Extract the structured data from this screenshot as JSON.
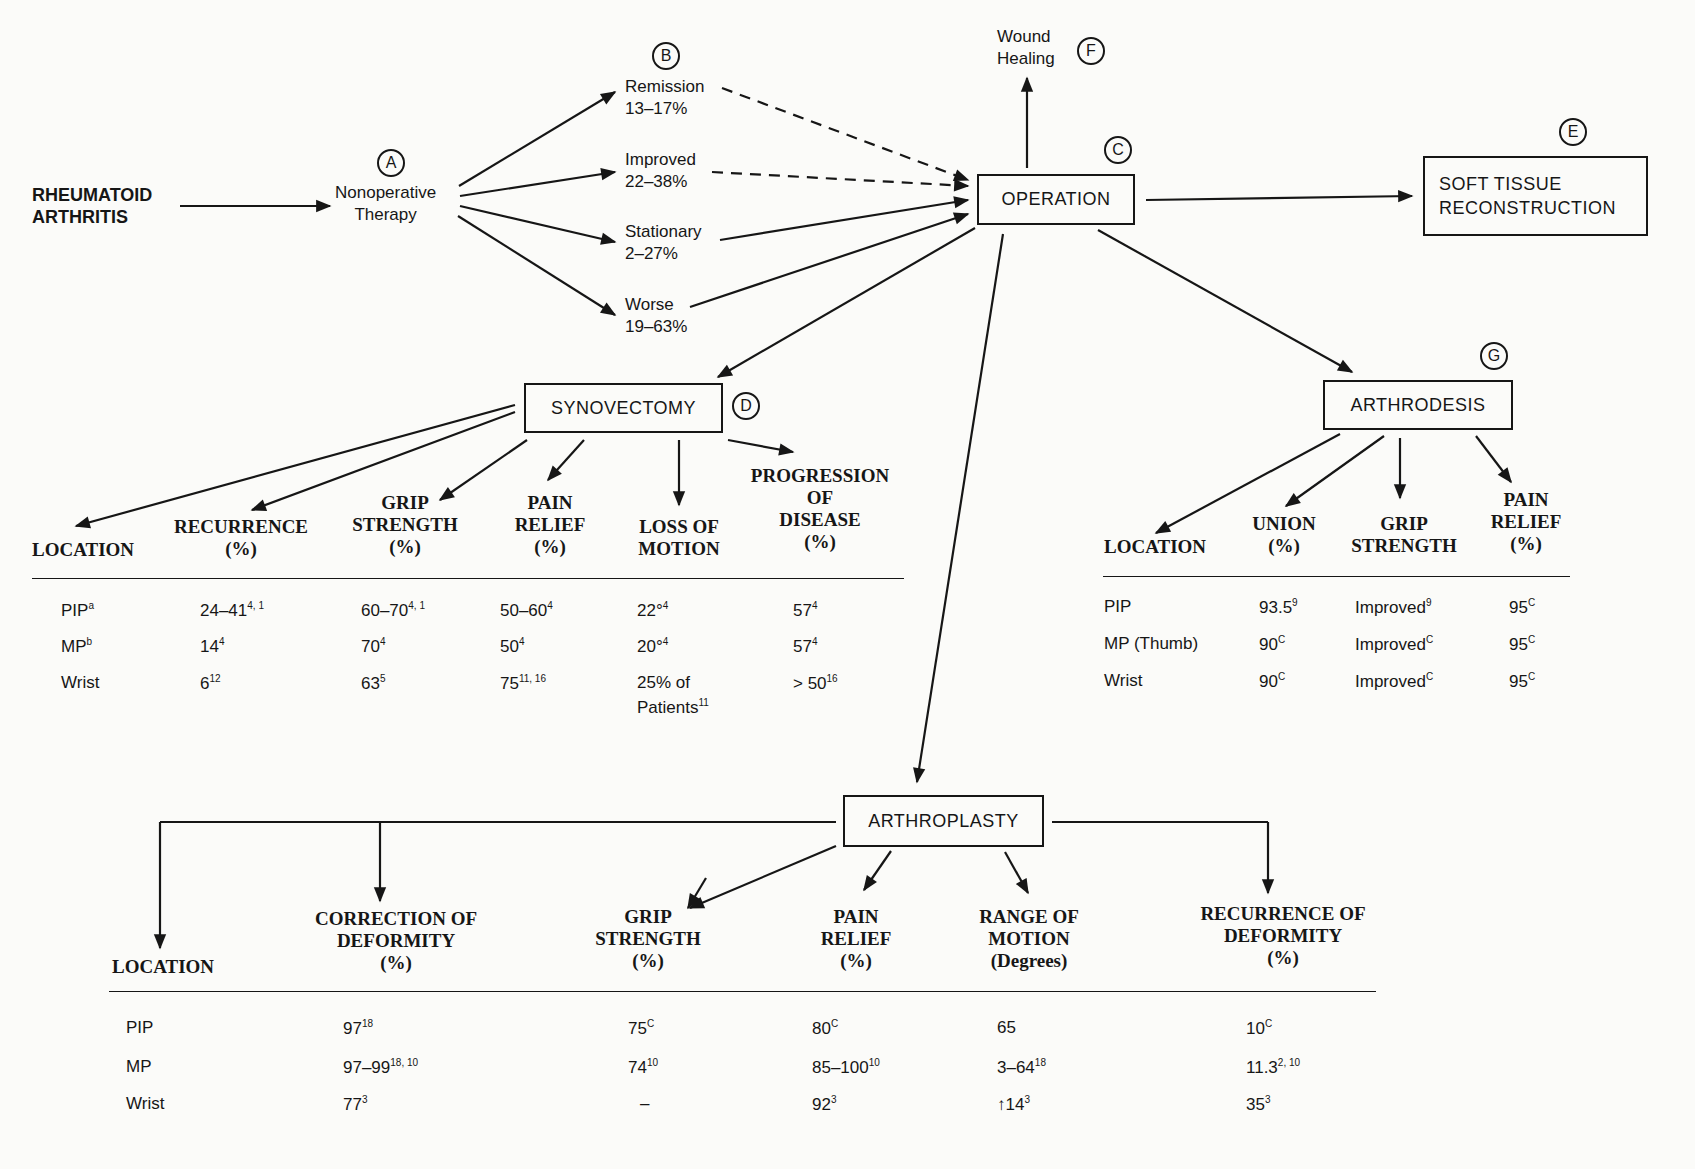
{
  "root": {
    "line1": "RHEUMATOID",
    "line2": "ARTHRITIS"
  },
  "nonoperative": {
    "marker": "A",
    "line1": "Nonoperative",
    "line2": "Therapy"
  },
  "outcomes": {
    "marker": "B",
    "items": [
      {
        "label": "Remission",
        "value": "13–17%",
        "to_operation": "dashed"
      },
      {
        "label": "Improved",
        "value": "22–38%",
        "to_operation": "dashed"
      },
      {
        "label": "Stationary",
        "value": "2–27%",
        "to_operation": "solid"
      },
      {
        "label": "Worse",
        "value": "19–63%",
        "to_operation": "solid"
      }
    ]
  },
  "operation": {
    "marker": "C",
    "label": "OPERATION"
  },
  "wound_healing": {
    "marker": "F",
    "line1": "Wound",
    "line2": "Healing"
  },
  "soft_tissue": {
    "marker": "E",
    "line1": "SOFT TISSUE",
    "line2": "RECONSTRUCTION"
  },
  "synovectomy": {
    "marker": "D",
    "label": "SYNOVECTOMY",
    "headers": [
      [
        "LOCATION"
      ],
      [
        "RECURRENCE",
        "(%)"
      ],
      [
        "GRIP",
        "STRENGTH",
        "(%)"
      ],
      [
        "PAIN",
        "RELIEF",
        "(%)"
      ],
      [
        "LOSS OF",
        "MOTION"
      ],
      [
        "PROGRESSION",
        "OF",
        "DISEASE",
        "(%)"
      ]
    ],
    "rows": [
      {
        "location": "PIP",
        "loc_sup": "a",
        "cells": [
          [
            "24–41",
            "4, 1"
          ],
          [
            "60–70",
            "4, 1"
          ],
          [
            "50–60",
            "4"
          ],
          [
            "22°",
            "4"
          ],
          [
            "57",
            "4"
          ]
        ]
      },
      {
        "location": "MP",
        "loc_sup": "b",
        "cells": [
          [
            "14",
            "4"
          ],
          [
            "70",
            "4"
          ],
          [
            "50",
            "4"
          ],
          [
            "20°",
            "4"
          ],
          [
            "57",
            "4"
          ]
        ]
      },
      {
        "location": "Wrist",
        "loc_sup": "",
        "cells": [
          [
            "6",
            "12"
          ],
          [
            "63",
            "5"
          ],
          [
            "75",
            "11, 16"
          ],
          [
            "25% of",
            ""
          ],
          [
            "> 50",
            "16"
          ]
        ],
        "extra_line": [
          "Patients",
          "11"
        ]
      }
    ]
  },
  "arthrodesis": {
    "marker": "G",
    "label": "ARTHRODESIS",
    "headers": [
      [
        "LOCATION"
      ],
      [
        "UNION",
        "(%)"
      ],
      [
        "GRIP",
        "STRENGTH"
      ],
      [
        "PAIN",
        "RELIEF",
        "(%)"
      ]
    ],
    "rows": [
      {
        "location": "PIP",
        "cells": [
          [
            "93.5",
            "9"
          ],
          [
            "Improved",
            "9"
          ],
          [
            "95",
            "C"
          ]
        ]
      },
      {
        "location": "MP (Thumb)",
        "cells": [
          [
            "90",
            "C"
          ],
          [
            "Improved",
            "C"
          ],
          [
            "95",
            "C"
          ]
        ]
      },
      {
        "location": "Wrist",
        "cells": [
          [
            "90",
            "C"
          ],
          [
            "Improved",
            "C"
          ],
          [
            "95",
            "C"
          ]
        ]
      }
    ]
  },
  "arthroplasty": {
    "label": "ARTHROPLASTY",
    "headers": [
      [
        "LOCATION"
      ],
      [
        "CORRECTION OF",
        "DEFORMITY",
        "(%)"
      ],
      [
        "GRIP",
        "STRENGTH",
        "(%)"
      ],
      [
        "PAIN",
        "RELIEF",
        "(%)"
      ],
      [
        "RANGE OF",
        "MOTION",
        "(Degrees)"
      ],
      [
        "RECURRENCE OF",
        "DEFORMITY",
        "(%)"
      ]
    ],
    "rows": [
      {
        "location": "PIP",
        "cells": [
          [
            "97",
            "18"
          ],
          [
            "75",
            "C"
          ],
          [
            "80",
            "C"
          ],
          [
            "65",
            ""
          ],
          [
            "10",
            "C"
          ]
        ]
      },
      {
        "location": "MP",
        "cells": [
          [
            "97–99",
            "18, 10"
          ],
          [
            "74",
            "10"
          ],
          [
            "85–100",
            "10"
          ],
          [
            "3–64",
            "18"
          ],
          [
            "11.3",
            "2, 10"
          ]
        ]
      },
      {
        "location": "Wrist",
        "cells": [
          [
            "77",
            "3"
          ],
          [
            "–",
            ""
          ],
          [
            "92",
            "3"
          ],
          [
            "↑14",
            "3"
          ],
          [
            "35",
            "3"
          ]
        ]
      }
    ]
  }
}
